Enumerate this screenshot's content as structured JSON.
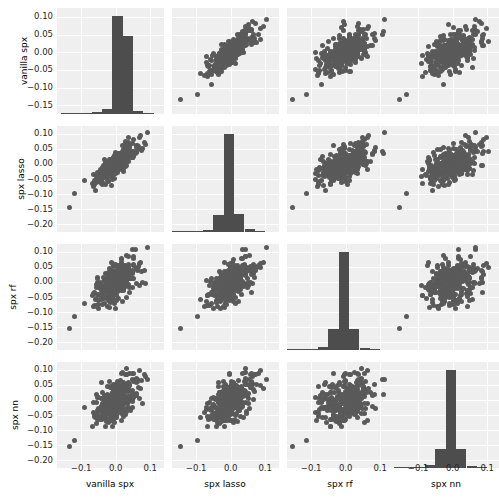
{
  "figure": {
    "type": "scatter-plot-matrix",
    "variables": [
      "vanilla spx",
      "spx lasso",
      "spx rf",
      "spx nn"
    ],
    "background_color": "#efefef",
    "point_color": "#5a5a5a",
    "bar_color": "#4d4d4d",
    "gridline_color": "#ffffff"
  },
  "axes": {
    "row_labels": [
      "vanilla spx",
      "spx lasso",
      "spx rf",
      "spx nn"
    ],
    "col_labels": [
      "vanilla spx",
      "spx lasso",
      "spx rf",
      "spx nn"
    ],
    "y_ticks_row0": [
      "0.10",
      "0.05",
      "0.00",
      "-0.05",
      "-0.10",
      "-0.15"
    ],
    "y_ticks_row1": [
      "0.10",
      "0.05",
      "0.00",
      "-0.05",
      "-0.10",
      "-0.15",
      "-0.20"
    ],
    "y_ticks_row2": [
      "0.10",
      "0.05",
      "0.00",
      "-0.05",
      "-0.10",
      "-0.15",
      "-0.20"
    ],
    "y_ticks_row3": [
      "0.10",
      "0.05",
      "0.00",
      "-0.05",
      "-0.10",
      "-0.15",
      "-0.20"
    ],
    "x_ticks": [
      "-0.1",
      "0.0",
      "0.1"
    ]
  },
  "chart_data": {
    "type": "scatter",
    "title": "",
    "xlabel": "",
    "ylabel": "",
    "variables": [
      "vanilla spx",
      "spx lasso",
      "spx rf",
      "spx nn"
    ],
    "xlim": [
      -0.17,
      0.14
    ],
    "ylim_row0": [
      -0.175,
      0.125
    ],
    "ylim_other": [
      -0.225,
      0.125
    ],
    "grid": true,
    "legend": "none",
    "diagonal": "histogram",
    "histograms": [
      {
        "variable": "vanilla spx",
        "bin_centers": [
          -0.145,
          -0.115,
          -0.085,
          -0.055,
          -0.025,
          0.005,
          0.035,
          0.065,
          0.095
        ],
        "counts": [
          1,
          1,
          2,
          4,
          9,
          176,
          140,
          5,
          2
        ],
        "note": "tall narrow spike near 0.00 with a slightly lower shoulder to its right"
      },
      {
        "variable": "spx lasso",
        "bin_centers": [
          -0.185,
          -0.155,
          -0.125,
          -0.095,
          -0.065,
          -0.035,
          -0.005,
          0.025,
          0.055,
          0.085
        ],
        "counts": [
          1,
          1,
          2,
          3,
          5,
          38,
          215,
          40,
          6,
          2
        ],
        "note": "very tall narrow spike just left of 0.00 on a wide low pedestal"
      },
      {
        "variable": "spx rf",
        "bin_centers": [
          -0.185,
          -0.155,
          -0.125,
          -0.095,
          -0.065,
          -0.035,
          -0.005,
          0.025,
          0.055,
          0.085
        ],
        "counts": [
          1,
          1,
          2,
          3,
          6,
          45,
          210,
          45,
          5,
          1
        ],
        "note": "tall narrow spike at 0.00 on a wide low pedestal"
      },
      {
        "variable": "spx nn",
        "bin_centers": [
          -0.185,
          -0.155,
          -0.125,
          -0.095,
          -0.065,
          -0.035,
          -0.005,
          0.025,
          0.055,
          0.085
        ],
        "counts": [
          1,
          1,
          2,
          3,
          6,
          42,
          218,
          42,
          5,
          1
        ],
        "note": "tall narrow spike at 0.00 on a wide low pedestal"
      }
    ],
    "pairs": [
      {
        "x": "spx lasso",
        "y": "vanilla spx",
        "correlation": 0.93,
        "relationship": "strong positive linear"
      },
      {
        "x": "spx rf",
        "y": "vanilla spx",
        "correlation": 0.45,
        "relationship": "weak positive, diffuse cloud"
      },
      {
        "x": "spx nn",
        "y": "vanilla spx",
        "correlation": 0.42,
        "relationship": "weak positive, diffuse cloud"
      },
      {
        "x": "vanilla spx",
        "y": "spx lasso",
        "correlation": 0.93,
        "relationship": "strong positive linear"
      },
      {
        "x": "spx rf",
        "y": "spx lasso",
        "correlation": 0.55,
        "relationship": "moderate positive"
      },
      {
        "x": "spx nn",
        "y": "spx lasso",
        "correlation": 0.5,
        "relationship": "moderate positive"
      },
      {
        "x": "vanilla spx",
        "y": "spx rf",
        "correlation": 0.45,
        "relationship": "weak positive"
      },
      {
        "x": "spx lasso",
        "y": "spx rf",
        "correlation": 0.55,
        "relationship": "moderate positive"
      },
      {
        "x": "spx nn",
        "y": "spx rf",
        "correlation": 0.58,
        "relationship": "moderate positive"
      },
      {
        "x": "vanilla spx",
        "y": "spx nn",
        "correlation": 0.42,
        "relationship": "weak positive"
      },
      {
        "x": "spx lasso",
        "y": "spx nn",
        "correlation": 0.5,
        "relationship": "moderate positive"
      },
      {
        "x": "spx rf",
        "y": "spx nn",
        "correlation": 0.58,
        "relationship": "moderate positive"
      }
    ],
    "n_points": 340
  }
}
